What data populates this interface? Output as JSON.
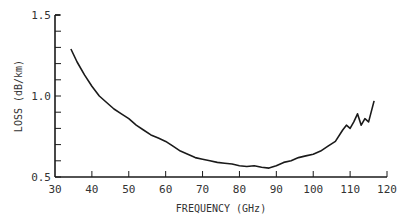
{
  "chart_data": {
    "type": "line",
    "title": "",
    "xlabel": "FREQUENCY (GHz)",
    "ylabel": "LOSS (dB/km)",
    "xlim": [
      30,
      120
    ],
    "ylim": [
      0.5,
      1.5
    ],
    "x_ticks": [
      30,
      40,
      50,
      60,
      70,
      80,
      90,
      100,
      110,
      120
    ],
    "x_tick_labels": [
      "30",
      "40",
      "50",
      "60",
      "70",
      "80",
      "90",
      "100",
      "110",
      "120"
    ],
    "y_ticks": [
      0.5,
      1.0,
      1.5
    ],
    "y_tick_labels": [
      "0.5",
      "1.0",
      "1.5"
    ],
    "y_minor_step": 0.1,
    "grid": false,
    "legend": null,
    "series": [
      {
        "name": "loss",
        "x": [
          34.3,
          36,
          38,
          40,
          42,
          44,
          46,
          48,
          50,
          52,
          54,
          56,
          58,
          60,
          62,
          64,
          66,
          68,
          70,
          72,
          74,
          76,
          78,
          80,
          82,
          84,
          86,
          88,
          90,
          92,
          94,
          96,
          98,
          100,
          102,
          104,
          106,
          108,
          109,
          110,
          111,
          112,
          113,
          114,
          115,
          116.5
        ],
        "y": [
          1.29,
          1.21,
          1.13,
          1.06,
          1.0,
          0.96,
          0.92,
          0.89,
          0.86,
          0.82,
          0.79,
          0.76,
          0.74,
          0.72,
          0.69,
          0.66,
          0.64,
          0.62,
          0.61,
          0.6,
          0.59,
          0.585,
          0.58,
          0.57,
          0.565,
          0.57,
          0.56,
          0.555,
          0.57,
          0.59,
          0.6,
          0.62,
          0.63,
          0.64,
          0.66,
          0.69,
          0.72,
          0.79,
          0.82,
          0.8,
          0.84,
          0.89,
          0.82,
          0.86,
          0.84,
          0.97
        ]
      }
    ]
  }
}
